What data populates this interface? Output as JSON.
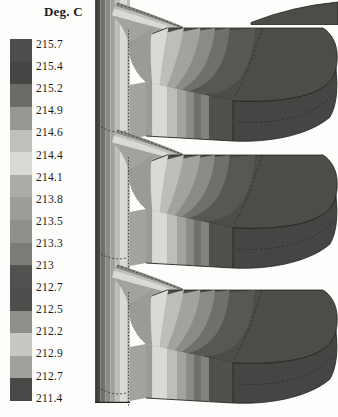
{
  "figure_title": "Deg. C",
  "legend": {
    "title": "Deg. C",
    "labels": [
      "215.7",
      "215.4",
      "215.2",
      "214.9",
      "214.6",
      "214.4",
      "214.1",
      "213.8",
      "213.5",
      "213.3",
      "213",
      "212.7",
      "212.5",
      "212.2",
      "212.9",
      "212.7",
      "211.4"
    ],
    "band_colors": [
      "#4d4d4b",
      "#454543",
      "#6b6b67",
      "#979793",
      "#bfbfbb",
      "#d9d9d5",
      "#ababa7",
      "#9c9c98",
      "#8f8f8b",
      "#7b7b77",
      "#525250",
      "#4e4e4c",
      "#8e8e8a",
      "#c7c7c3",
      "#a0a09c",
      "#484846"
    ]
  },
  "palette": {
    "darkest": "#454543",
    "dark": "#4c4c49",
    "dark2": "#575753",
    "dark3": "#50504d",
    "medium_dark": "#6f6f6b",
    "medium_dark2": "#82827e",
    "medium": "#8a8a86",
    "medium_light": "#a2a29e",
    "light": "#bdbdb9",
    "cream": "#dad9d4",
    "root": "#9a9a96",
    "outline": "#222220",
    "dashline": "#2a2a28",
    "bg": "#fdfdfb"
  },
  "chart_data": {
    "type": "heatmap",
    "subtype": "3d-temperature-contour-plot",
    "title": "Deg. C",
    "units": "Deg. C",
    "legend_position": "left",
    "n_fins": 3,
    "temperature_range": [
      211.4,
      215.7
    ],
    "contour_levels_as_printed": [
      "215.7",
      "215.4",
      "215.2",
      "214.9",
      "214.6",
      "214.4",
      "214.1",
      "213.8",
      "213.5",
      "213.3",
      "213",
      "212.7",
      "212.5",
      "212.2",
      "212.9",
      "212.7",
      "211.4"
    ],
    "contour_levels_numeric": [
      215.7,
      215.4,
      215.2,
      214.9,
      214.6,
      214.4,
      214.1,
      213.8,
      213.5,
      213.3,
      213.0,
      212.7,
      212.5,
      212.2,
      211.9,
      211.7,
      211.4
    ],
    "note": "The two labels printed as 212.9 and 212.7 near the bottom of the source legend appear out of numeric sequence; the monotonic sequence implies 211.9 and 211.7.",
    "level_band_colors": [
      "#4d4d4b",
      "#454543",
      "#6b6b67",
      "#979793",
      "#bfbfbb",
      "#d9d9d5",
      "#ababa7",
      "#9c9c98",
      "#8f8f8b",
      "#7b7b77",
      "#525250",
      "#4e4e4c",
      "#8e8e8a",
      "#c7c7c3",
      "#a0a09c",
      "#484846"
    ]
  }
}
